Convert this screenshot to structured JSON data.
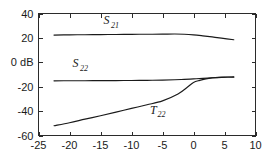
{
  "chart_data": {
    "type": "line",
    "title": "",
    "subtitle": "",
    "xlabel": "",
    "ylabel": "",
    "xlim": [
      -25,
      10
    ],
    "ylim": [
      -60,
      40
    ],
    "grid": false,
    "legend_position": "inline-annotations",
    "x_ticks": [
      -25,
      -20,
      -15,
      -10,
      -5,
      0,
      5,
      10
    ],
    "x_tick_labels": [
      "-25",
      "-20",
      "-15",
      "-10",
      "-5",
      "0",
      "5",
      "10"
    ],
    "y_ticks": [
      40,
      20,
      0,
      -20,
      -40,
      -60
    ],
    "y_tick_labels": [
      "40",
      "20",
      "0 dB",
      "-20",
      "-40",
      "-60"
    ],
    "series": [
      {
        "name": "S21",
        "label_base": "S",
        "label_sub": "21",
        "label_x": -14.5,
        "label_y": 31,
        "x": [
          -22.5,
          -20,
          -17.5,
          -15,
          -12.5,
          -10,
          -7.5,
          -5,
          -3,
          -1.5,
          0,
          1.5,
          3,
          4.5,
          6.5
        ],
        "y": [
          22.3,
          22.5,
          22.6,
          22.7,
          22.8,
          22.9,
          23.0,
          23.1,
          23.2,
          23.0,
          22.5,
          21.7,
          20.8,
          19.8,
          18.5
        ]
      },
      {
        "name": "S22",
        "label_base": "S",
        "label_sub": "22",
        "label_x": -19.5,
        "label_y": -4,
        "x": [
          -22.5,
          -20,
          -17.5,
          -15,
          -12.5,
          -10,
          -7.5,
          -5,
          -3,
          -1.5,
          0,
          1.5,
          3,
          4.5,
          6.5
        ],
        "y": [
          -15.2,
          -15.1,
          -15.1,
          -15.0,
          -15.0,
          -14.9,
          -14.8,
          -14.6,
          -14.3,
          -14.0,
          -13.6,
          -13.2,
          -12.7,
          -12.3,
          -12.0
        ]
      },
      {
        "name": "T22",
        "label_base": "T",
        "label_sub": "22",
        "label_x": -7.0,
        "label_y": -42,
        "x": [
          -22.5,
          -20,
          -17.5,
          -15,
          -12.5,
          -10,
          -7.5,
          -5,
          -2.5,
          -1.0,
          0,
          1.0,
          2.0,
          3.0,
          4.0,
          5.0,
          6.5
        ],
        "y": [
          -52.0,
          -49.5,
          -46.6,
          -43.8,
          -40.8,
          -37.8,
          -34.8,
          -31.6,
          -26.0,
          -20.5,
          -16.5,
          -14.8,
          -13.6,
          -12.8,
          -12.3,
          -12.1,
          -12.1
        ]
      }
    ]
  }
}
